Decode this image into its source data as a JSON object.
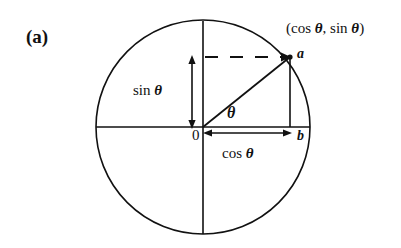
{
  "figure": {
    "panel_label": "(a)",
    "background_color": "#ffffff",
    "stroke_color": "#111111",
    "labels": {
      "coordinate_point": "(cos θ, sin θ)",
      "point_a": "a",
      "point_b": "b",
      "origin": "0",
      "sine_segment": "sin θ",
      "cosine_segment": "cos θ",
      "angle": "θ"
    }
  },
  "chart_data": {
    "type": "diagram",
    "subtitle": "",
    "xlabel": "",
    "ylabel": "",
    "grid": false,
    "legend": "none",
    "geometry": {
      "circle": {
        "center_x": 203,
        "center_y": 127,
        "radius": 107
      },
      "axes": {
        "horizontal": {
          "x1": 96,
          "y1": 127,
          "x2": 310,
          "y2": 127
        },
        "vertical": {
          "x1": 203,
          "y1": 21,
          "x2": 203,
          "y2": 234
        }
      },
      "point_a": {
        "x": 290,
        "y": 57,
        "label": "a",
        "meaning": "(cos θ, sin θ)"
      },
      "point_b": {
        "x": 290,
        "y": 127,
        "label": "b",
        "meaning": "foot of perpendicular on x-axis"
      },
      "radius_line": {
        "x1": 203,
        "y1": 127,
        "x2": 290,
        "y2": 57
      },
      "drop_line": {
        "x1": 290,
        "y1": 57,
        "x2": 290,
        "y2": 127
      },
      "dashed_line": {
        "x1": 203,
        "y1": 57,
        "x2": 290,
        "y2": 57
      },
      "sin_arrow": {
        "x": 192,
        "y_top": 57,
        "y_bottom": 127,
        "double_headed": true
      },
      "cos_arrow": {
        "y": 133,
        "x_left": 205,
        "x_right": 290,
        "double_headed": true
      }
    },
    "annotations": [
      {
        "text": "(cos θ, sin θ)",
        "x": 286,
        "y": 28
      },
      {
        "text": "a",
        "x": 297,
        "y": 54
      },
      {
        "text": "b",
        "x": 297,
        "y": 136
      },
      {
        "text": "0",
        "x": 192,
        "y": 136
      },
      {
        "text": "sin θ",
        "x": 133,
        "y": 92
      },
      {
        "text": "cos θ",
        "x": 222,
        "y": 155
      },
      {
        "text": "θ",
        "x": 227,
        "y": 116
      },
      {
        "text": "(a)",
        "x": 26,
        "y": 38
      }
    ]
  }
}
